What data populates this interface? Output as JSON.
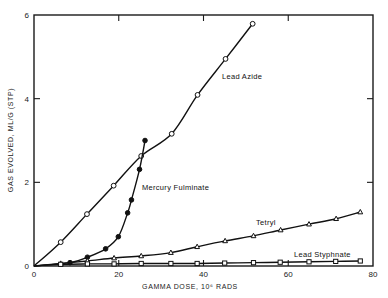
{
  "chart_data": {
    "type": "line",
    "title": "",
    "xlabel": "GAMMA DOSE, 10⁶ RADS",
    "ylabel": "GAS EVOLVED, ML/G (STP)",
    "xlim": [
      0,
      80
    ],
    "ylim": [
      0,
      6
    ],
    "xticks": [
      0,
      20,
      40,
      60,
      80
    ],
    "xtick_labels": [
      "0",
      "20",
      "40",
      "60",
      "80"
    ],
    "yticks": [
      0,
      2,
      4,
      6
    ],
    "ytick_labels": [
      "0",
      "2",
      "4",
      "6"
    ],
    "grid": false,
    "legend": "inline labels",
    "series": [
      {
        "name": "Lead Azide",
        "marker": "open-circle",
        "label_pos": [
          222,
          79
        ],
        "points": [
          [
            0,
            0
          ],
          [
            6.3,
            0.57
          ],
          [
            12.5,
            1.24
          ],
          [
            18.8,
            1.92
          ],
          [
            25.3,
            2.63
          ],
          [
            32.5,
            3.16
          ],
          [
            38.6,
            4.09
          ],
          [
            45.2,
            4.95
          ],
          [
            51.6,
            5.79
          ]
        ]
      },
      {
        "name": "Mercury Fulminate",
        "marker": "filled-circle",
        "label_pos": [
          142,
          190
        ],
        "points": [
          [
            0,
            0
          ],
          [
            8.5,
            0.08
          ],
          [
            12.6,
            0.21
          ],
          [
            16.9,
            0.41
          ],
          [
            19.9,
            0.7
          ],
          [
            22.1,
            1.27
          ],
          [
            23.0,
            1.58
          ],
          [
            24.9,
            2.31
          ],
          [
            26.2,
            3.0
          ]
        ]
      },
      {
        "name": "Tetryl",
        "marker": "open-triangle",
        "label_pos": [
          256,
          225
        ],
        "points": [
          [
            0,
            0
          ],
          [
            6.3,
            0.06
          ],
          [
            12.6,
            0.12
          ],
          [
            18.9,
            0.19
          ],
          [
            25.3,
            0.24
          ],
          [
            32.3,
            0.32
          ],
          [
            38.5,
            0.46
          ],
          [
            45.1,
            0.6
          ],
          [
            51.8,
            0.72
          ],
          [
            58.2,
            0.86
          ],
          [
            64.9,
            1.0
          ],
          [
            71.3,
            1.13
          ],
          [
            77.0,
            1.29
          ]
        ]
      },
      {
        "name": "Lead Styphnate",
        "marker": "open-square",
        "label_pos": [
          294,
          257
        ],
        "points": [
          [
            0,
            0
          ],
          [
            6.3,
            0.04
          ],
          [
            12.6,
            0.05
          ],
          [
            18.9,
            0.05
          ],
          [
            25.3,
            0.06
          ],
          [
            32.3,
            0.06
          ],
          [
            38.5,
            0.06
          ],
          [
            45.0,
            0.07
          ],
          [
            51.8,
            0.08
          ],
          [
            58.1,
            0.09
          ],
          [
            64.9,
            0.1
          ],
          [
            71.2,
            0.11
          ],
          [
            77.0,
            0.12
          ]
        ]
      }
    ]
  },
  "layout": {
    "plot_left": 34,
    "plot_right": 373,
    "plot_top": 15,
    "plot_bottom": 266
  }
}
